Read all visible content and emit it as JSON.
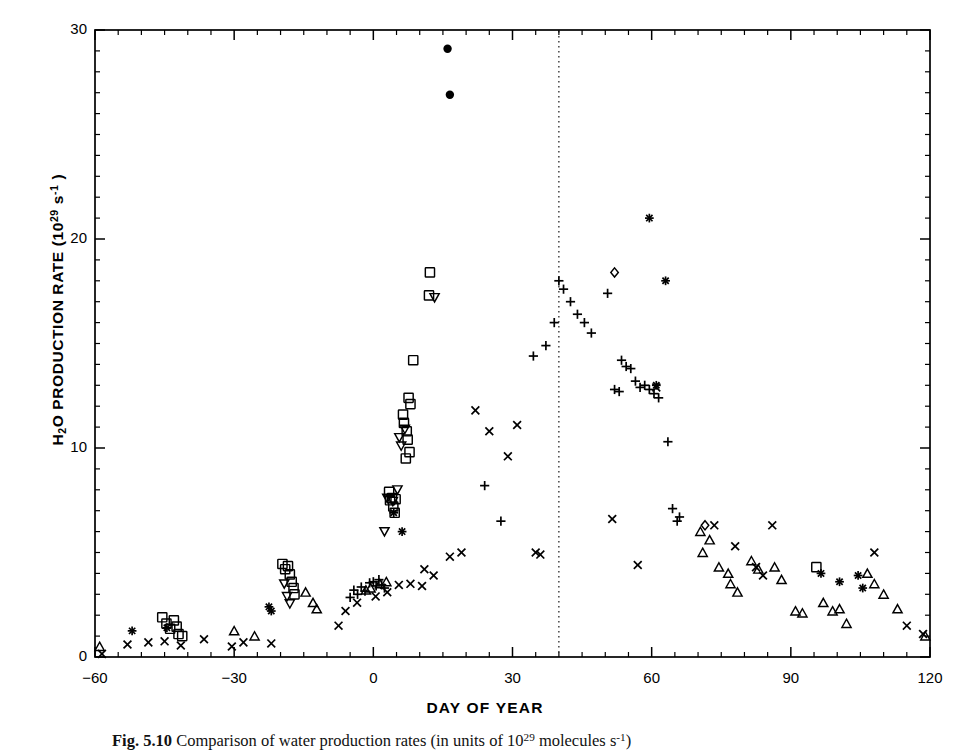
{
  "figure": {
    "ylabel_text": "H2O PRODUCTION RATE (1029 s-1)",
    "xlabel": "DAY OF YEAR",
    "caption_prefix": "Fig. 5.10",
    "caption_text": "Comparison of water production rates (in units of 10",
    "caption_exp": "29",
    "caption_tail": " molecules s",
    "caption_exp2": "-1",
    "caption_end": ")"
  },
  "chart_data": {
    "type": "scatter",
    "title": "",
    "xlabel": "DAY OF YEAR",
    "ylabel": "H2O PRODUCTION RATE (10^29 s^-1)",
    "xlim": [
      -60,
      120
    ],
    "ylim": [
      0,
      30
    ],
    "xticks": [
      -60,
      -30,
      0,
      30,
      60,
      90,
      120
    ],
    "yticks": [
      0,
      10,
      20,
      30
    ],
    "minor_tick_interval_y": 1,
    "minor_tick_interval_x": 5,
    "grid": false,
    "legend": "none",
    "annotations": [
      {
        "type": "vline",
        "x": 40,
        "style": "dotted",
        "label": "perihelion"
      }
    ],
    "series": [
      {
        "name": "filled-circle",
        "marker": "circle-filled",
        "points": [
          [
            16,
            29.1
          ],
          [
            16.5,
            26.9
          ]
        ]
      },
      {
        "name": "open-square",
        "marker": "square",
        "points": [
          [
            -45.5,
            1.9
          ],
          [
            -44.6,
            1.6
          ],
          [
            -43.8,
            1.35
          ],
          [
            -43.0,
            1.75
          ],
          [
            -42.4,
            1.45
          ],
          [
            -42.0,
            1.1
          ],
          [
            -41.2,
            1.0
          ],
          [
            -19.6,
            4.45
          ],
          [
            -19.0,
            4.2
          ],
          [
            -18.4,
            4.35
          ],
          [
            -18.0,
            3.95
          ],
          [
            -17.6,
            3.6
          ],
          [
            -17.2,
            3.3
          ],
          [
            -17.0,
            3.0
          ],
          [
            3.4,
            7.9
          ],
          [
            3.6,
            7.5
          ],
          [
            4.3,
            7.2
          ],
          [
            4.6,
            6.9
          ],
          [
            4.0,
            7.6
          ],
          [
            4.8,
            7.55
          ],
          [
            6.4,
            11.6
          ],
          [
            6.6,
            11.2
          ],
          [
            7.2,
            10.8
          ],
          [
            7.4,
            10.4
          ],
          [
            7.6,
            12.4
          ],
          [
            8.0,
            12.1
          ],
          [
            7.0,
            9.5
          ],
          [
            7.8,
            9.8
          ],
          [
            8.6,
            14.2
          ],
          [
            12.2,
            18.4
          ],
          [
            12.0,
            17.3
          ],
          [
            95.5,
            4.3
          ]
        ]
      },
      {
        "name": "open-down-triangle",
        "marker": "triangle-down",
        "points": [
          [
            -19.2,
            3.5
          ],
          [
            -18.6,
            2.9
          ],
          [
            -18.0,
            2.55
          ],
          [
            2.4,
            6.0
          ],
          [
            3.0,
            7.6
          ],
          [
            4.2,
            7.45
          ],
          [
            5.6,
            10.5
          ],
          [
            6.0,
            10.1
          ],
          [
            6.8,
            10.9
          ],
          [
            5.2,
            8.0
          ],
          [
            13.2,
            17.2
          ]
        ]
      },
      {
        "name": "open-up-triangle",
        "marker": "triangle-up",
        "points": [
          [
            -59.0,
            0.5
          ],
          [
            -30.0,
            1.25
          ],
          [
            -25.6,
            1.0
          ],
          [
            -14.6,
            3.1
          ],
          [
            -13.0,
            2.6
          ],
          [
            -12.2,
            2.3
          ],
          [
            -1.6,
            3.2
          ],
          [
            -0.6,
            3.3
          ],
          [
            1.4,
            3.5
          ],
          [
            2.8,
            3.6
          ],
          [
            70.5,
            6.0
          ],
          [
            72.5,
            5.6
          ],
          [
            71.0,
            5.0
          ],
          [
            74.5,
            4.3
          ],
          [
            76.5,
            4.0
          ],
          [
            77.0,
            3.5
          ],
          [
            78.5,
            3.1
          ],
          [
            81.5,
            4.6
          ],
          [
            83.0,
            4.2
          ],
          [
            86.5,
            4.3
          ],
          [
            88.0,
            3.7
          ],
          [
            91.0,
            2.2
          ],
          [
            92.5,
            2.1
          ],
          [
            97.0,
            2.6
          ],
          [
            99.0,
            2.2
          ],
          [
            100.5,
            2.3
          ],
          [
            102.0,
            1.6
          ],
          [
            106.5,
            4.0
          ],
          [
            108.0,
            3.5
          ],
          [
            110.0,
            3.0
          ],
          [
            113.0,
            2.3
          ],
          [
            119.0,
            1.0
          ]
        ]
      },
      {
        "name": "plus",
        "marker": "plus",
        "points": [
          [
            -4.2,
            3.2
          ],
          [
            -3.4,
            3.0
          ],
          [
            -2.6,
            3.35
          ],
          [
            -1.8,
            3.15
          ],
          [
            -0.8,
            3.55
          ],
          [
            0.0,
            3.6
          ],
          [
            0.6,
            3.4
          ],
          [
            1.2,
            3.7
          ],
          [
            1.8,
            3.45
          ],
          [
            2.4,
            3.3
          ],
          [
            -5.0,
            2.85
          ],
          [
            24.0,
            8.2
          ],
          [
            27.5,
            6.5
          ],
          [
            34.5,
            14.4
          ],
          [
            37.2,
            14.9
          ],
          [
            39.0,
            16.0
          ],
          [
            40.0,
            18.0
          ],
          [
            41.0,
            17.6
          ],
          [
            42.5,
            17.0
          ],
          [
            44.0,
            16.4
          ],
          [
            45.5,
            16.0
          ],
          [
            47.0,
            15.5
          ],
          [
            50.5,
            17.4
          ],
          [
            53.5,
            14.2
          ],
          [
            54.5,
            13.9
          ],
          [
            55.5,
            13.8
          ],
          [
            56.5,
            13.2
          ],
          [
            57.5,
            12.9
          ],
          [
            58.5,
            13.0
          ],
          [
            59.5,
            12.8
          ],
          [
            60.5,
            12.6
          ],
          [
            61.5,
            12.4
          ],
          [
            52.0,
            12.8
          ],
          [
            53.0,
            12.7
          ],
          [
            63.5,
            10.3
          ],
          [
            64.5,
            7.1
          ],
          [
            65.5,
            6.5
          ],
          [
            66.0,
            6.7
          ]
        ]
      },
      {
        "name": "cross",
        "marker": "x",
        "points": [
          [
            -58.5,
            0.15
          ],
          [
            -53.0,
            0.6
          ],
          [
            -48.5,
            0.7
          ],
          [
            -45.0,
            0.75
          ],
          [
            -41.5,
            0.55
          ],
          [
            -36.5,
            0.85
          ],
          [
            -30.5,
            0.5
          ],
          [
            -28.0,
            0.7
          ],
          [
            -22.0,
            0.65
          ],
          [
            -7.5,
            1.5
          ],
          [
            -6.0,
            2.2
          ],
          [
            -3.5,
            2.6
          ],
          [
            0.5,
            2.9
          ],
          [
            3.0,
            3.1
          ],
          [
            5.5,
            3.45
          ],
          [
            8.0,
            3.5
          ],
          [
            10.5,
            3.4
          ],
          [
            11.0,
            4.2
          ],
          [
            13.0,
            3.9
          ],
          [
            16.5,
            4.8
          ],
          [
            19.0,
            5.0
          ],
          [
            22.0,
            11.8
          ],
          [
            25.0,
            10.8
          ],
          [
            29.0,
            9.6
          ],
          [
            31.0,
            11.1
          ],
          [
            35.0,
            5.0
          ],
          [
            36.0,
            4.9
          ],
          [
            51.5,
            6.6
          ],
          [
            57.0,
            4.4
          ],
          [
            61.0,
            12.9
          ],
          [
            73.5,
            6.3
          ],
          [
            78.0,
            5.3
          ],
          [
            82.5,
            4.3
          ],
          [
            84.0,
            3.9
          ],
          [
            86.0,
            6.3
          ],
          [
            108.0,
            5.0
          ],
          [
            115.0,
            1.5
          ],
          [
            118.5,
            1.1
          ]
        ]
      },
      {
        "name": "asterisk",
        "marker": "asterisk",
        "points": [
          [
            -52.0,
            1.25
          ],
          [
            -44.5,
            1.4
          ],
          [
            -22.5,
            2.4
          ],
          [
            -22.0,
            2.2
          ],
          [
            4.4,
            6.9
          ],
          [
            6.2,
            6.0
          ],
          [
            59.5,
            21.0
          ],
          [
            63.0,
            18.0
          ],
          [
            61.0,
            13.0
          ],
          [
            96.5,
            4.0
          ],
          [
            100.5,
            3.6
          ],
          [
            104.5,
            3.9
          ],
          [
            105.5,
            3.3
          ]
        ]
      },
      {
        "name": "open-diamond",
        "marker": "diamond",
        "points": [
          [
            52.0,
            18.4
          ],
          [
            71.5,
            6.3
          ]
        ]
      }
    ]
  }
}
